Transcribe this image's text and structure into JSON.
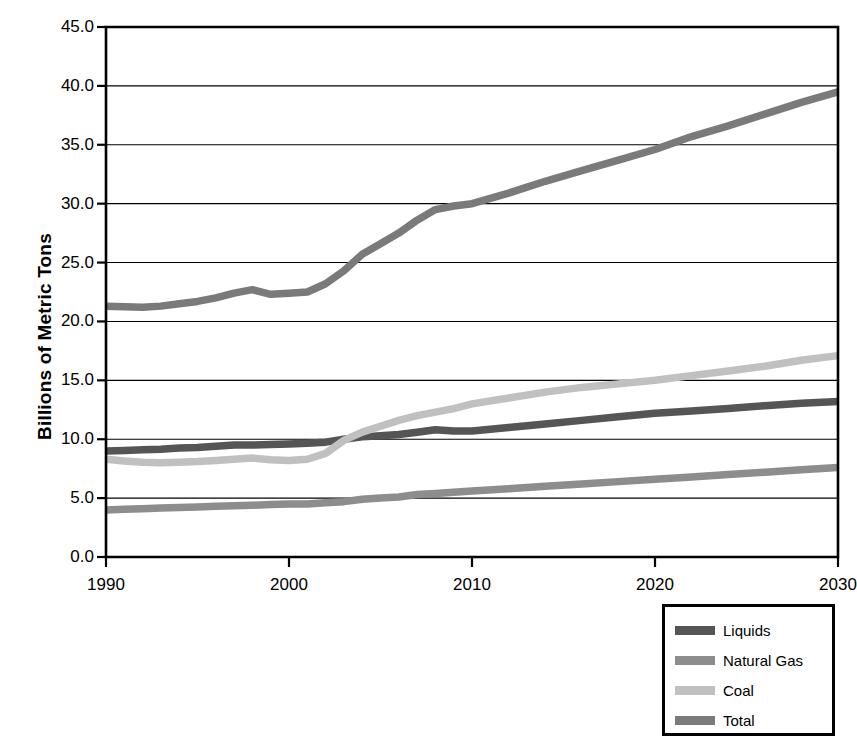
{
  "chart_data": {
    "type": "line",
    "title": "",
    "xlabel": "",
    "ylabel": "Billions of Metric Tons",
    "xlim": [
      1990,
      2030
    ],
    "ylim": [
      0.0,
      45.0
    ],
    "grid": true,
    "legend_position": "bottom-right-outside",
    "x_ticks": [
      1990,
      2000,
      2010,
      2020,
      2030
    ],
    "x_tick_labels": [
      "1990",
      "2000",
      "2010",
      "2020",
      "2030"
    ],
    "y_ticks": [
      0.0,
      5.0,
      10.0,
      15.0,
      20.0,
      25.0,
      30.0,
      35.0,
      40.0,
      45.0
    ],
    "y_tick_labels": [
      "0.0",
      "5.0",
      "10.0",
      "15.0",
      "20.0",
      "25.0",
      "30.0",
      "35.0",
      "40.0",
      "45.0"
    ],
    "x": [
      1990,
      1991,
      1992,
      1993,
      1994,
      1995,
      1996,
      1997,
      1998,
      1999,
      2000,
      2001,
      2002,
      2003,
      2004,
      2005,
      2006,
      2007,
      2008,
      2009,
      2010,
      2012,
      2014,
      2016,
      2018,
      2020,
      2022,
      2024,
      2026,
      2028,
      2030
    ],
    "series": [
      {
        "name": "Liquids",
        "color": "#555555",
        "values": [
          9.0,
          9.05,
          9.1,
          9.15,
          9.25,
          9.3,
          9.4,
          9.5,
          9.5,
          9.55,
          9.6,
          9.65,
          9.75,
          10.0,
          10.2,
          10.3,
          10.4,
          10.6,
          10.8,
          10.7,
          10.7,
          11.0,
          11.3,
          11.6,
          11.9,
          12.2,
          12.4,
          12.6,
          12.85,
          13.05,
          13.2
        ]
      },
      {
        "name": "Natural Gas",
        "color": "#8d8d8d",
        "values": [
          4.0,
          4.05,
          4.1,
          4.15,
          4.2,
          4.25,
          4.3,
          4.35,
          4.4,
          4.45,
          4.5,
          4.5,
          4.6,
          4.7,
          4.9,
          5.0,
          5.1,
          5.3,
          5.4,
          5.5,
          5.6,
          5.8,
          6.0,
          6.2,
          6.4,
          6.6,
          6.8,
          7.0,
          7.2,
          7.4,
          7.6
        ]
      },
      {
        "name": "Coal",
        "color": "#c0c0c0",
        "values": [
          8.3,
          8.15,
          8.05,
          8.0,
          8.05,
          8.1,
          8.2,
          8.3,
          8.4,
          8.25,
          8.2,
          8.3,
          8.8,
          9.9,
          10.6,
          11.1,
          11.6,
          12.0,
          12.3,
          12.6,
          13.0,
          13.5,
          14.0,
          14.4,
          14.7,
          15.0,
          15.4,
          15.8,
          16.2,
          16.7,
          17.1
        ]
      },
      {
        "name": "Total",
        "color": "#7a7a7a",
        "values": [
          21.3,
          21.25,
          21.2,
          21.3,
          21.5,
          21.7,
          22.0,
          22.4,
          22.7,
          22.3,
          22.4,
          22.5,
          23.2,
          24.3,
          25.7,
          26.6,
          27.5,
          28.6,
          29.5,
          29.8,
          30.0,
          30.9,
          31.9,
          32.8,
          33.7,
          34.6,
          35.7,
          36.6,
          37.6,
          38.6,
          39.5
        ]
      }
    ]
  },
  "legend": {
    "items": [
      {
        "label": "Liquids",
        "color": "#555555"
      },
      {
        "label": "Natural Gas",
        "color": "#8d8d8d"
      },
      {
        "label": "Coal",
        "color": "#c0c0c0"
      },
      {
        "label": "Total",
        "color": "#7a7a7a"
      }
    ]
  }
}
